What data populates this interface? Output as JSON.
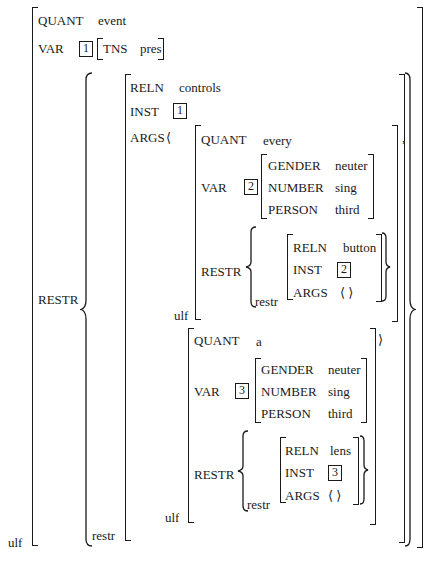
{
  "avm": {
    "outer": {
      "quant_attr": "QUANT",
      "quant_val": "event",
      "var_attr": "VAR",
      "var_tag": "1",
      "tns_attr": "TNS",
      "tns_val": "pres",
      "restr_attr": "RESTR",
      "ulf_label": "ulf"
    },
    "controls": {
      "reln_attr": "RELN",
      "reln_val": "controls",
      "inst_attr": "INST",
      "inst_tag": "1",
      "args_attr": "ARGS",
      "args_open": "⟨",
      "restr_label": "restr"
    },
    "arg1": {
      "quant_attr": "QUANT",
      "quant_val": "every",
      "var_attr": "VAR",
      "var_tag": "2",
      "gender_attr": "GENDER",
      "gender_val": "neuter",
      "number_attr": "NUMBER",
      "number_val": "sing",
      "person_attr": "PERSON",
      "person_val": "third",
      "restr_attr": "RESTR",
      "restr_label": "restr",
      "reln_attr": "RELN",
      "reln_val": "button",
      "inst_attr": "INST",
      "inst_tag": "2",
      "args_attr": "ARGS",
      "args_val": "⟨  ⟩",
      "ulf_label": "ulf",
      "separator": ","
    },
    "arg2": {
      "quant_attr": "QUANT",
      "quant_val": "a",
      "var_attr": "VAR",
      "var_tag": "3",
      "gender_attr": "GENDER",
      "gender_val": "neuter",
      "number_attr": "NUMBER",
      "number_val": "sing",
      "person_attr": "PERSON",
      "person_val": "third",
      "restr_attr": "RESTR",
      "restr_label": "restr",
      "reln_attr": "RELN",
      "reln_val": "lens",
      "inst_attr": "INST",
      "inst_tag": "3",
      "args_attr": "ARGS",
      "args_val": "⟨  ⟩",
      "ulf_label": "ulf",
      "args_close": "⟩"
    },
    "braces": {
      "open": "{",
      "close": "}"
    }
  }
}
